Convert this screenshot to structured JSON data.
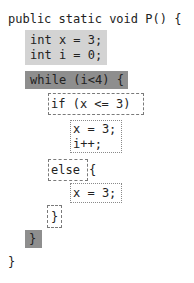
{
  "code": {
    "signature": "public static void P() {",
    "decl_block": [
      "int x = 3;",
      "int i = 0;"
    ],
    "while_header": "while (i<4) {",
    "if_header": "if (x <= 3)",
    "if_body": [
      "x = 3;",
      "i++;"
    ],
    "else_header": "else",
    "else_open_brace": "{",
    "else_body": [
      "x = 3;"
    ],
    "else_close_brace": "}",
    "while_close_brace": "}",
    "method_close_brace": "}"
  },
  "styles": {
    "decl_block_fill": "#d3d3d3",
    "while_fill": "#8e8e8e",
    "condition_border": "dashed",
    "statement_border": "dotted"
  }
}
